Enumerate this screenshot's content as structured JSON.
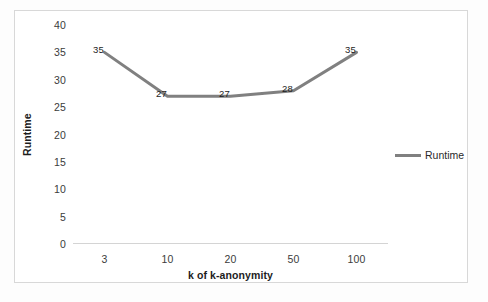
{
  "chart_data": {
    "type": "line",
    "title": "",
    "xlabel": "k of k-anonymity",
    "ylabel": "Runtime",
    "categories": [
      "3",
      "10",
      "20",
      "50",
      "100"
    ],
    "values": [
      35,
      27,
      27,
      28,
      35
    ],
    "data_labels": [
      "35",
      "27",
      "27",
      "28",
      "35"
    ],
    "ylim": [
      0,
      40
    ],
    "ytick_labels": [
      "40",
      "35",
      "30",
      "25",
      "20",
      "15",
      "10",
      "5",
      "0"
    ],
    "ytick_values": [
      40,
      35,
      30,
      25,
      20,
      15,
      10,
      5,
      0
    ],
    "grid": false,
    "legend": {
      "position": "right",
      "entries": [
        {
          "name": "Runtime",
          "color": "#808080",
          "marker": "line"
        }
      ]
    },
    "series": [
      {
        "name": "Runtime",
        "color": "#808080",
        "values": [
          35,
          27,
          27,
          28,
          35
        ]
      }
    ]
  },
  "colors": {
    "series_line": "#808080",
    "axis_line": "#d4d4d4",
    "frame_border": "#d8d8d8",
    "tick_text": "#3b3b3b",
    "title_text": "#1d1d1d"
  }
}
